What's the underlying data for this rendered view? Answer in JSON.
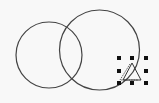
{
  "canvas": {
    "width": 159,
    "height": 103,
    "background": "#f8f8f8",
    "stroke_color": "#444444"
  },
  "shapes": [
    {
      "type": "circle",
      "name": "left-circle",
      "cx": 49,
      "cy": 55,
      "r": 33
    },
    {
      "type": "circle",
      "name": "right-circle",
      "cx": 99.5,
      "cy": 50,
      "r": 40
    },
    {
      "type": "triangle",
      "name": "selected-triangle",
      "points": "132,63 123,80 141,80",
      "selected": true
    }
  ],
  "selection": {
    "handle_color": "#111111",
    "handle_size": 4,
    "handles_x": [
      119,
      132,
      146
    ],
    "handles_y": [
      58,
      71,
      83
    ]
  }
}
